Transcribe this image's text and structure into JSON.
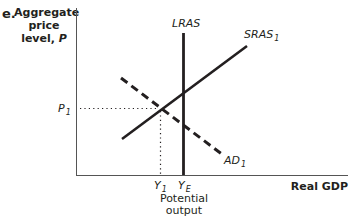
{
  "figure": {
    "panel_letter": "e.",
    "y_axis_label_line1": "Aggregate",
    "y_axis_label_line2": "price",
    "y_axis_label_line3": "level, ",
    "y_axis_label_var": "P",
    "x_axis_label": "Real GDP"
  },
  "curves": {
    "lras": {
      "label": "LRAS",
      "style": "solid-vertical"
    },
    "sras": {
      "label": "SRAS",
      "subscript": "1",
      "style": "solid-upward"
    },
    "ad": {
      "label": "AD",
      "subscript": "1",
      "style": "dashed-downward"
    }
  },
  "markers": {
    "p1": {
      "label": "P",
      "subscript": "1"
    },
    "y1": {
      "label": "Y",
      "subscript": "1"
    },
    "ye": {
      "label": "Y",
      "subscript": "E",
      "caption_line1": "Potential",
      "caption_line2": "output"
    }
  },
  "colors": {
    "ink": "#231f20",
    "axis": "#555555"
  }
}
